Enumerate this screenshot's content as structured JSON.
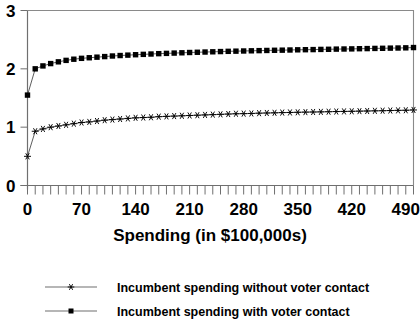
{
  "chart_data": {
    "type": "line",
    "title": "",
    "xlabel": "Spending (in $100,000s)",
    "ylabel": "",
    "xlim": [
      0,
      500
    ],
    "ylim": [
      0,
      3
    ],
    "grid": false,
    "legend_position": "bottom",
    "x_tick_labels": [
      "0",
      "70",
      "140",
      "210",
      "280",
      "350",
      "420",
      "490"
    ],
    "x_tick_values": [
      0,
      70,
      140,
      210,
      280,
      350,
      420,
      490
    ],
    "x_minor_tick_interval": 10,
    "y_tick_labels": [
      "0",
      "1",
      "2",
      "3"
    ],
    "y_tick_values": [
      0,
      1,
      2,
      3
    ],
    "x": [
      0,
      10,
      20,
      30,
      40,
      50,
      60,
      70,
      80,
      90,
      100,
      110,
      120,
      130,
      140,
      150,
      160,
      170,
      180,
      190,
      200,
      210,
      220,
      230,
      240,
      250,
      260,
      270,
      280,
      290,
      300,
      310,
      320,
      330,
      340,
      350,
      360,
      370,
      380,
      390,
      400,
      410,
      420,
      430,
      440,
      450,
      460,
      470,
      480,
      490,
      500
    ],
    "series": [
      {
        "name": "Incumbent spending without voter contact",
        "marker": "star",
        "color": "#000000",
        "values": [
          0.5,
          0.93,
          0.97,
          1.0,
          1.02,
          1.04,
          1.06,
          1.08,
          1.09,
          1.105,
          1.12,
          1.13,
          1.14,
          1.15,
          1.16,
          1.165,
          1.17,
          1.18,
          1.185,
          1.19,
          1.195,
          1.2,
          1.205,
          1.21,
          1.215,
          1.22,
          1.225,
          1.23,
          1.232,
          1.235,
          1.24,
          1.243,
          1.246,
          1.25,
          1.252,
          1.255,
          1.258,
          1.26,
          1.262,
          1.265,
          1.268,
          1.27,
          1.272,
          1.275,
          1.277,
          1.28,
          1.282,
          1.285,
          1.288,
          1.29,
          1.295
        ]
      },
      {
        "name": "Incumbent spending with voter contact",
        "marker": "square",
        "color": "#000000",
        "values": [
          1.55,
          2.0,
          2.05,
          2.09,
          2.12,
          2.145,
          2.165,
          2.18,
          2.19,
          2.2,
          2.21,
          2.22,
          2.228,
          2.235,
          2.242,
          2.248,
          2.254,
          2.26,
          2.265,
          2.27,
          2.275,
          2.28,
          2.284,
          2.288,
          2.292,
          2.296,
          2.3,
          2.303,
          2.306,
          2.309,
          2.312,
          2.315,
          2.318,
          2.32,
          2.323,
          2.326,
          2.328,
          2.33,
          2.333,
          2.335,
          2.338,
          2.34,
          2.342,
          2.345,
          2.347,
          2.35,
          2.352,
          2.355,
          2.357,
          2.36,
          2.365
        ]
      }
    ]
  },
  "legend": {
    "entries": [
      {
        "label": "Incumbent spending without voter contact",
        "marker": "star"
      },
      {
        "label": "Incumbent spending with voter contact",
        "marker": "square"
      }
    ]
  },
  "colors": {
    "series": "#000000",
    "line": "#4c4c4c",
    "axis": "#6f6f6f",
    "frame": "#8a8a8a",
    "background": "#ffffff"
  }
}
